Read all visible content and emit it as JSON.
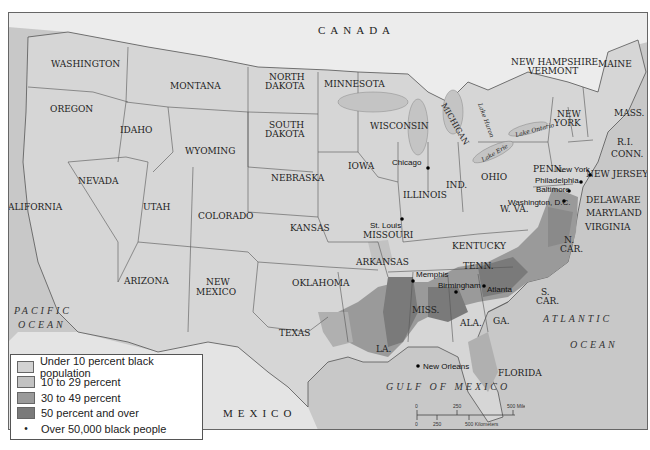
{
  "map": {
    "countries": [
      "CANADA",
      "MEXICO"
    ],
    "water_bodies": [
      "PACIFIC",
      "OCEAN",
      "ATLANTIC",
      "OCEAN",
      "GULF OF MEXICO"
    ],
    "lakes": [
      "Lake Erie",
      "Lake Ontario",
      "Lake Huron"
    ],
    "states": {
      "washington": "WASHINGTON",
      "oregon": "OREGON",
      "california": "CALIFORNIA",
      "nevada": "NEVADA",
      "idaho": "IDAHO",
      "montana": "MONTANA",
      "wyoming": "WYOMING",
      "utah": "UTAH",
      "arizona": "ARIZONA",
      "colorado": "COLORADO",
      "new_mexico_1": "NEW",
      "new_mexico_2": "MEXICO",
      "north_dakota_1": "NORTH",
      "north_dakota_2": "DAKOTA",
      "south_dakota_1": "SOUTH",
      "south_dakota_2": "DAKOTA",
      "nebraska": "NEBRASKA",
      "kansas": "KANSAS",
      "oklahoma": "OKLAHOMA",
      "texas": "TEXAS",
      "minnesota": "MINNESOTA",
      "iowa": "IOWA",
      "missouri": "MISSOURI",
      "arkansas": "ARKANSAS",
      "louisiana": "LA.",
      "wisconsin": "WISCONSIN",
      "illinois": "ILLINOIS",
      "michigan": "MICHIGAN",
      "indiana": "IND.",
      "ohio": "OHIO",
      "kentucky": "KENTUCKY",
      "tennessee": "TENN.",
      "mississippi": "MISS.",
      "alabama": "ALA.",
      "georgia": "GA.",
      "florida": "FLORIDA",
      "south_carolina_1": "S.",
      "south_carolina_2": "CAR.",
      "north_carolina_1": "N.",
      "north_carolina_2": "CAR.",
      "virginia": "VIRGINIA",
      "west_virginia": "W. VA.",
      "maryland": "MARYLAND",
      "delaware": "DELAWARE",
      "new_jersey": "NEW JERSEY",
      "pennsylvania": "PENN.",
      "new_york_1": "NEW",
      "new_york_2": "YORK",
      "connecticut": "CONN.",
      "rhode_island": "R.I.",
      "massachusetts": "MASS.",
      "vermont": "VERMONT",
      "new_hampshire": "NEW HAMPSHIRE",
      "maine": "MAINE"
    },
    "cities": [
      {
        "name": "Chicago"
      },
      {
        "name": "St. Louis"
      },
      {
        "name": "New York"
      },
      {
        "name": "Philadelphia"
      },
      {
        "name": "Baltimore"
      },
      {
        "name": "Washington, D.C."
      },
      {
        "name": "Memphis"
      },
      {
        "name": "Birmingham"
      },
      {
        "name": "Atlanta"
      },
      {
        "name": "New Orleans"
      }
    ]
  },
  "legend": {
    "items": [
      {
        "label": "Under 10 percent black population",
        "color": "#d2d2d2"
      },
      {
        "label": "10 to 29 percent",
        "color": "#c2c2c2"
      },
      {
        "label": "30 to 49 percent",
        "color": "#9a9a9a"
      },
      {
        "label": "50 percent and over",
        "color": "#7a7a7a"
      },
      {
        "label": "Over 50,000 black people",
        "symbol": "•"
      }
    ]
  },
  "scale_bar": {
    "miles": [
      "0",
      "250",
      "500 Miles"
    ],
    "kilometers": [
      "0",
      "250",
      "500 Kilometers"
    ]
  },
  "colors": {
    "land": "#d6d6d6",
    "foreign_land": "#e6e6e6",
    "water": "#c4c4c4",
    "canada": "#ededed",
    "border": "#555555"
  }
}
